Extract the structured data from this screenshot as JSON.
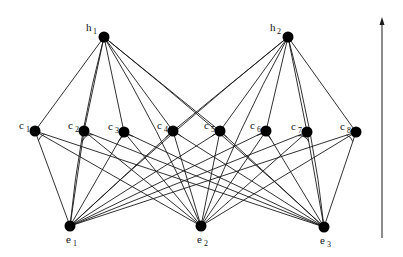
{
  "diagram": {
    "title": "",
    "layers": [
      "h",
      "c",
      "e"
    ],
    "nodes": [
      {
        "id": "h1",
        "base": "h",
        "sub": "1",
        "x": 104,
        "y": 37,
        "label_pos": "upper-left"
      },
      {
        "id": "h2",
        "base": "h",
        "sub": "2",
        "x": 288,
        "y": 37,
        "label_pos": "upper-left"
      },
      {
        "id": "c1",
        "base": "c",
        "sub": "1",
        "x": 35,
        "y": 131,
        "label_pos": "upper-left"
      },
      {
        "id": "c2",
        "base": "c",
        "sub": "2",
        "x": 84,
        "y": 131,
        "label_pos": "upper-left"
      },
      {
        "id": "c3",
        "base": "c",
        "sub": "3",
        "x": 124,
        "y": 132,
        "label_pos": "upper-left"
      },
      {
        "id": "c4",
        "base": "c",
        "sub": "4",
        "x": 173,
        "y": 131,
        "label_pos": "upper-left"
      },
      {
        "id": "c5",
        "base": "c",
        "sub": "5",
        "x": 220,
        "y": 131,
        "label_pos": "upper-left"
      },
      {
        "id": "c6",
        "base": "c",
        "sub": "6",
        "x": 266,
        "y": 131,
        "label_pos": "upper-left"
      },
      {
        "id": "c7",
        "base": "c",
        "sub": "7",
        "x": 307,
        "y": 132,
        "label_pos": "upper-left"
      },
      {
        "id": "c8",
        "base": "c",
        "sub": "8",
        "x": 356,
        "y": 132,
        "label_pos": "upper-left"
      },
      {
        "id": "e1",
        "base": "e",
        "sub": "1",
        "x": 70,
        "y": 226,
        "label_pos": "below"
      },
      {
        "id": "e2",
        "base": "e",
        "sub": "2",
        "x": 201,
        "y": 226,
        "label_pos": "below"
      },
      {
        "id": "e3",
        "base": "e",
        "sub": "3",
        "x": 324,
        "y": 227,
        "label_pos": "below"
      }
    ],
    "edges": [
      [
        "h1",
        "c1"
      ],
      [
        "h1",
        "c2"
      ],
      [
        "h1",
        "c3"
      ],
      [
        "h1",
        "c4"
      ],
      [
        "h1",
        "c5"
      ],
      [
        "h1",
        "e1"
      ],
      [
        "h1",
        "e2"
      ],
      [
        "h1",
        "e3"
      ],
      [
        "h2",
        "c5"
      ],
      [
        "h2",
        "c6"
      ],
      [
        "h2",
        "c7"
      ],
      [
        "h2",
        "c8"
      ],
      [
        "h2",
        "c4"
      ],
      [
        "h2",
        "e1"
      ],
      [
        "h2",
        "e2"
      ],
      [
        "h2",
        "e3"
      ],
      [
        "c1",
        "e1"
      ],
      [
        "c1",
        "e2"
      ],
      [
        "c1",
        "e3"
      ],
      [
        "c2",
        "e1"
      ],
      [
        "c2",
        "e2"
      ],
      [
        "c2",
        "e3"
      ],
      [
        "c3",
        "e1"
      ],
      [
        "c3",
        "e2"
      ],
      [
        "c3",
        "e3"
      ],
      [
        "c4",
        "e1"
      ],
      [
        "c4",
        "e2"
      ],
      [
        "c4",
        "e3"
      ],
      [
        "c5",
        "e1"
      ],
      [
        "c5",
        "e2"
      ],
      [
        "c5",
        "e3"
      ],
      [
        "c6",
        "e1"
      ],
      [
        "c6",
        "e2"
      ],
      [
        "c6",
        "e3"
      ],
      [
        "c7",
        "e1"
      ],
      [
        "c7",
        "e2"
      ],
      [
        "c7",
        "e3"
      ],
      [
        "c8",
        "e1"
      ],
      [
        "c8",
        "e2"
      ],
      [
        "c8",
        "e3"
      ]
    ],
    "and_arcs": [
      "c1",
      "c2",
      "c3",
      "c4",
      "c5",
      "c6",
      "c7",
      "c8"
    ],
    "arrow": {
      "x": 382,
      "y_bottom": 238,
      "y_top": 17,
      "direction": "up"
    }
  }
}
